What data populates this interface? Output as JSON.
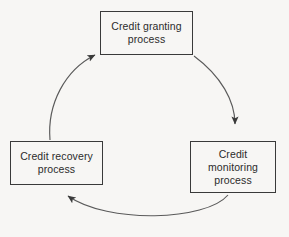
{
  "diagram": {
    "title_fragment": "",
    "background_color": "#f7f6f4",
    "stroke_color": "#3a3a3a",
    "text_color": "#2b2b2b",
    "nodes": [
      {
        "id": "granting",
        "label": "Credit granting\nprocess",
        "position": "top"
      },
      {
        "id": "monitoring",
        "label": "Credit\nmonitoring\nprocess",
        "position": "right"
      },
      {
        "id": "recovery",
        "label": "Credit recovery\nprocess",
        "position": "left"
      }
    ],
    "arrows": [
      {
        "id": "granting-to-monitoring",
        "from": "granting",
        "to": "monitoring",
        "style": "curved",
        "direction": "clockwise"
      },
      {
        "id": "monitoring-to-recovery",
        "from": "monitoring",
        "to": "recovery",
        "style": "curved",
        "direction": "clockwise"
      },
      {
        "id": "recovery-to-granting",
        "from": "recovery",
        "to": "granting",
        "style": "curved",
        "direction": "clockwise"
      }
    ]
  }
}
